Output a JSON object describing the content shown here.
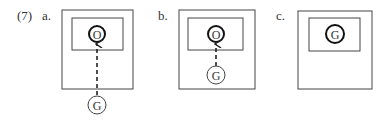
{
  "example_number": "(7)",
  "panels": [
    {
      "id": "a",
      "label": "a.",
      "outer_node": "G",
      "inner_node": "O",
      "edge": "dashed arrow from G (outside) to O (inside)"
    },
    {
      "id": "b",
      "label": "b.",
      "outer_node": "G",
      "inner_node": "O",
      "edge": "dashed arrow from G to O"
    },
    {
      "id": "c",
      "label": "c.",
      "inner_node": "G"
    }
  ],
  "colors": {
    "stroke": "#333333",
    "background": "#ffffff"
  }
}
